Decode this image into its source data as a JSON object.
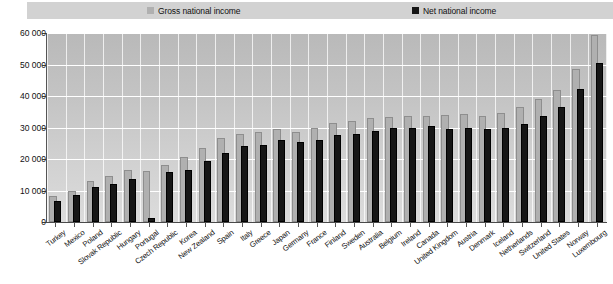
{
  "legend": {
    "entries": [
      {
        "label": "Gross national income",
        "color": "#b0b0b0",
        "key": "gross"
      },
      {
        "label": "Net national income",
        "color": "#161616",
        "key": "net"
      }
    ]
  },
  "axis": {
    "y_ticks": [
      "0",
      "10 000",
      "20 000",
      "30 000",
      "40 000",
      "50 000",
      "60 000"
    ]
  },
  "chart_data": {
    "type": "bar",
    "title": "",
    "subtitle": "",
    "xlabel": "",
    "ylabel": "",
    "ylim": [
      0,
      60000
    ],
    "ytick_step": 10000,
    "grid": true,
    "legend_position": "top",
    "categories": [
      "Turkey",
      "Mexico",
      "Poland",
      "Slovak Republic",
      "Hungary",
      "Portugal",
      "Czech Republic",
      "Korea",
      "New Zealand",
      "Spain",
      "Italy",
      "Greece",
      "Japan",
      "Germany",
      "France",
      "Finland",
      "Sweden",
      "Australia",
      "Belgium",
      "Ireland",
      "Canada",
      "United Kingdom",
      "Austria",
      "Denmark",
      "Iceland",
      "Netherlands",
      "Switzerland",
      "United States",
      "Norway",
      "Luxembourg"
    ],
    "series": [
      {
        "name": "Gross national income",
        "color": "#b0b0b0",
        "values": [
          8200,
          10000,
          13000,
          14500,
          16500,
          16300,
          18000,
          20500,
          23500,
          26700,
          28000,
          28500,
          29500,
          28600,
          29800,
          31500,
          32000,
          33000,
          33200,
          33500,
          33800,
          34000,
          34200,
          33800,
          34500,
          36500,
          39000,
          42000,
          48500,
          59500
        ]
      },
      {
        "name": "Net national income",
        "color": "#161616",
        "values": [
          6800,
          8700,
          11000,
          12000,
          13500,
          1200,
          16000,
          16500,
          19500,
          22000,
          24000,
          24500,
          26000,
          25500,
          26000,
          27500,
          28000,
          29000,
          30000,
          29800,
          30500,
          29600,
          30000,
          29500,
          29800,
          31000,
          33500,
          36500,
          42200,
          50500
        ]
      }
    ]
  }
}
